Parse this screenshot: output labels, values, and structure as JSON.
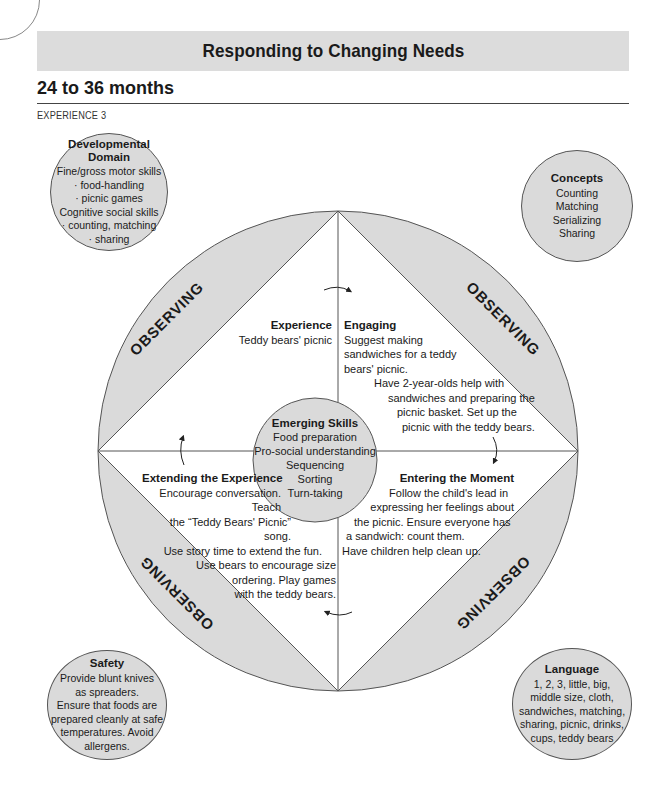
{
  "header": {
    "banner_title": "Responding to Changing Needs",
    "section_title": "24 to 36 months",
    "sub_label": "EXPERIENCE 3"
  },
  "diagram": {
    "colors": {
      "fill_gray": "#dadada",
      "line": "#555555",
      "background": "#ffffff"
    },
    "observing_labels": [
      "OBSERVING",
      "OBSERVING",
      "OBSERVING",
      "OBSERVING"
    ],
    "experience": {
      "heading": "Experience",
      "text": "Teddy bears' picnic"
    },
    "engaging": {
      "heading": "Engaging",
      "lines": [
        "Suggest making",
        "sandwiches for a teddy",
        "bears' picnic.",
        "Have 2-year-olds help with",
        "sandwiches and preparing the",
        "picnic basket. Set up the",
        "picnic with the teddy bears."
      ]
    },
    "extending": {
      "heading": "Extending the Experience",
      "lines": [
        "Encourage conversation. Teach",
        "the “Teddy Bears' Picnic” song.",
        "Use story time to extend the fun.",
        "Use bears to encourage size",
        "ordering. Play games",
        "with the teddy bears."
      ]
    },
    "entering": {
      "heading": "Entering the Moment",
      "lines": [
        "Follow the child's lead in",
        "expressing her feelings about",
        "the picnic. Ensure everyone has",
        "a sandwich: count them.",
        "Have children help clean up."
      ]
    },
    "emerging_skills": {
      "heading": "Emerging Skills",
      "items": [
        "Food preparation",
        "Pro-social understanding",
        "Sequencing",
        "Sorting",
        "Turn-taking"
      ]
    }
  },
  "bubbles": {
    "developmental_domain": {
      "heading_line1": "Developmental",
      "heading_line2": "Domain",
      "lines": [
        "Fine/gross motor skills",
        "· food-handling",
        "· picnic games",
        "Cognitive social skills",
        "· counting, matching",
        "· sharing"
      ]
    },
    "concepts": {
      "heading": "Concepts",
      "lines": [
        "Counting",
        "Matching",
        "Serializing",
        "Sharing"
      ]
    },
    "safety": {
      "heading": "Safety",
      "lines": [
        "Provide blunt knives",
        "as spreaders.",
        "Ensure that foods are",
        "prepared cleanly at safe",
        "temperatures. Avoid",
        "allergens."
      ]
    },
    "language": {
      "heading": "Language",
      "lines": [
        "1, 2, 3, little, big,",
        "middle size, cloth,",
        "sandwiches, matching,",
        "sharing, picnic, drinks,",
        "cups, teddy bears"
      ]
    }
  }
}
